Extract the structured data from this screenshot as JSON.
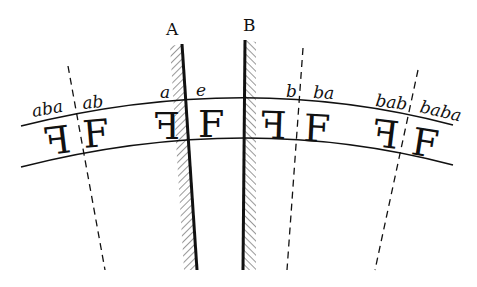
{
  "figure": {
    "mirrors": [
      {
        "label": "A",
        "x1": 182,
        "y1": 44,
        "x2": 197,
        "y2": 270,
        "hatch_side": "left"
      },
      {
        "label": "B",
        "x1": 245,
        "y1": 40,
        "x2": 243,
        "y2": 270,
        "hatch_side": "right"
      }
    ],
    "dashed_lines": [
      {
        "name": "aba-ab-boundary",
        "x1": 68,
        "y1": 66,
        "x2": 105,
        "y2": 270
      },
      {
        "name": "b-ba-boundary",
        "x1": 303,
        "y1": 48,
        "x2": 287,
        "y2": 270
      },
      {
        "name": "bab-baba-boundary",
        "x1": 418,
        "y1": 70,
        "x2": 375,
        "y2": 270
      }
    ],
    "band": {
      "upper_arc": {
        "start": [
          21,
          126
        ],
        "control": [
          245,
          70
        ],
        "end": [
          453,
          125
        ]
      },
      "lower_arc": {
        "start": [
          21,
          167
        ],
        "control": [
          245,
          110
        ],
        "end": [
          453,
          165
        ]
      }
    },
    "word_labels": [
      {
        "text": "aba",
        "x": 33,
        "y": 117,
        "rot": -10
      },
      {
        "text": "ab",
        "x": 83,
        "y": 108,
        "rot": -6
      },
      {
        "text": "a",
        "x": 160,
        "y": 97,
        "rot": 0
      },
      {
        "text": "e",
        "x": 196,
        "y": 96,
        "rot": 0
      },
      {
        "text": "b",
        "x": 285,
        "y": 98,
        "rot": 0
      },
      {
        "text": "ba",
        "x": 313,
        "y": 100,
        "rot": 3
      },
      {
        "text": "bab",
        "x": 375,
        "y": 108,
        "rot": 6
      },
      {
        "text": "baba",
        "x": 420,
        "y": 115,
        "rot": 12
      }
    ],
    "glyphs": [
      {
        "char": "F",
        "mirrored": true,
        "x": 48,
        "y": 152,
        "rot": -7
      },
      {
        "char": "F",
        "mirrored": false,
        "x": 84,
        "y": 148,
        "rot": -5
      },
      {
        "char": "F",
        "mirrored": true,
        "x": 155,
        "y": 140,
        "rot": 0
      },
      {
        "char": "F",
        "mirrored": false,
        "x": 197,
        "y": 138,
        "rot": 0
      },
      {
        "char": "F",
        "mirrored": true,
        "x": 262,
        "y": 140,
        "rot": 2
      },
      {
        "char": "F",
        "mirrored": false,
        "x": 304,
        "y": 142,
        "rot": 3
      },
      {
        "char": "F",
        "mirrored": true,
        "x": 374,
        "y": 150,
        "rot": 7
      },
      {
        "char": "F",
        "mirrored": false,
        "x": 411,
        "y": 155,
        "rot": 9
      }
    ],
    "labels": {
      "mirror_a": "A",
      "mirror_b": "B",
      "w_aba": "aba",
      "w_ab": "ab",
      "w_a": "a",
      "w_e": "e",
      "w_b": "b",
      "w_ba": "ba",
      "w_bab": "bab",
      "w_baba": "baba",
      "glyph": "F"
    }
  }
}
